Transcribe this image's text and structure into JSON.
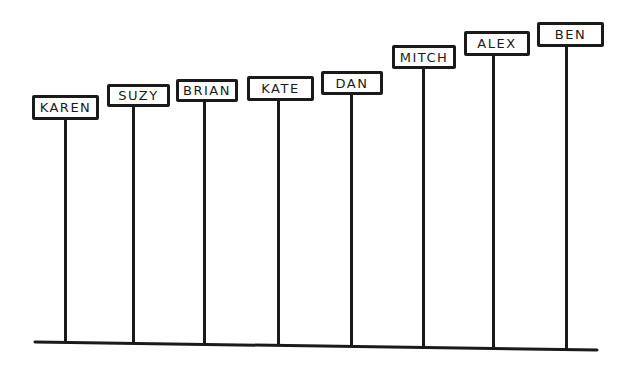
{
  "diagram": {
    "type": "signposts-ascending",
    "stroke_color": "#1a1a1a",
    "background": "#ffffff",
    "baseline": {
      "x1": 35,
      "y1": 342,
      "x2": 597,
      "y2": 350
    },
    "signs": [
      {
        "name": "KAREN",
        "box": {
          "x": 32,
          "y": 95,
          "w": 67,
          "h": 25
        },
        "pole_x": 65,
        "pole_bottom": 343
      },
      {
        "name": "SUZY",
        "box": {
          "x": 107,
          "y": 84,
          "w": 63,
          "h": 23
        },
        "pole_x": 133,
        "pole_bottom": 344
      },
      {
        "name": "BRIAN",
        "box": {
          "x": 176,
          "y": 79,
          "w": 62,
          "h": 23
        },
        "pole_x": 204,
        "pole_bottom": 345
      },
      {
        "name": "KATE",
        "box": {
          "x": 247,
          "y": 76,
          "w": 67,
          "h": 25
        },
        "pole_x": 278,
        "pole_bottom": 346
      },
      {
        "name": "DAN",
        "box": {
          "x": 321,
          "y": 71,
          "w": 62,
          "h": 24
        },
        "pole_x": 351,
        "pole_bottom": 347
      },
      {
        "name": "MITCH",
        "box": {
          "x": 392,
          "y": 45,
          "w": 64,
          "h": 24
        },
        "pole_x": 423,
        "pole_bottom": 348
      },
      {
        "name": "ALEX",
        "box": {
          "x": 464,
          "y": 31,
          "w": 66,
          "h": 25
        },
        "pole_x": 493,
        "pole_bottom": 349
      },
      {
        "name": "BEN",
        "box": {
          "x": 537,
          "y": 22,
          "w": 67,
          "h": 25
        },
        "pole_x": 566,
        "pole_bottom": 350
      }
    ]
  }
}
